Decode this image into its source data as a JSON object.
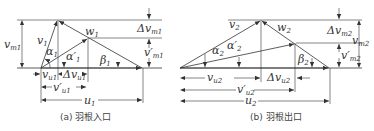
{
  "diagram": {
    "panels": [
      {
        "id": "a",
        "caption": "(a) 羽根入口",
        "labels": {
          "v_m": "v",
          "v_m_sub": "m1",
          "v": "v",
          "v_sub": "1",
          "alpha": "α",
          "alpha_sub": "1",
          "alpha_p": "α′",
          "alpha_p_sub": "1",
          "w": "w",
          "w_sub": "1",
          "beta": "β",
          "beta_sub": "1",
          "dv_m": "Δv",
          "dv_m_sub": "m1",
          "v_m_p": "v′",
          "v_m_p_sub": "m1",
          "v_u": "v",
          "v_u_sub": "u1",
          "dv_u": "Δv",
          "dv_u_sub": "u1",
          "v_u_p": "v′",
          "v_u_p_sub": "u1",
          "u": "u",
          "u_sub": "1"
        }
      },
      {
        "id": "b",
        "caption": "(b) 羽根出口",
        "labels": {
          "v": "v",
          "v_sub": "2",
          "w": "w",
          "w_sub": "2",
          "alpha": "α",
          "alpha_sub": "2",
          "alpha_p": "α′",
          "alpha_p_sub": "2",
          "beta": "β",
          "beta_sub": "2",
          "dv_m": "Δv",
          "dv_m_sub": "m2",
          "v_m": "v",
          "v_m_sub": "m2",
          "v_m_p": "v′",
          "v_m_p_sub": "m2",
          "v_u": "v",
          "v_u_sub": "u2",
          "dv_u": "Δv",
          "dv_u_sub": "u2",
          "v_u_p": "v′",
          "v_u_p_sub": "u2",
          "u": "u",
          "u_sub": "2"
        }
      }
    ]
  }
}
